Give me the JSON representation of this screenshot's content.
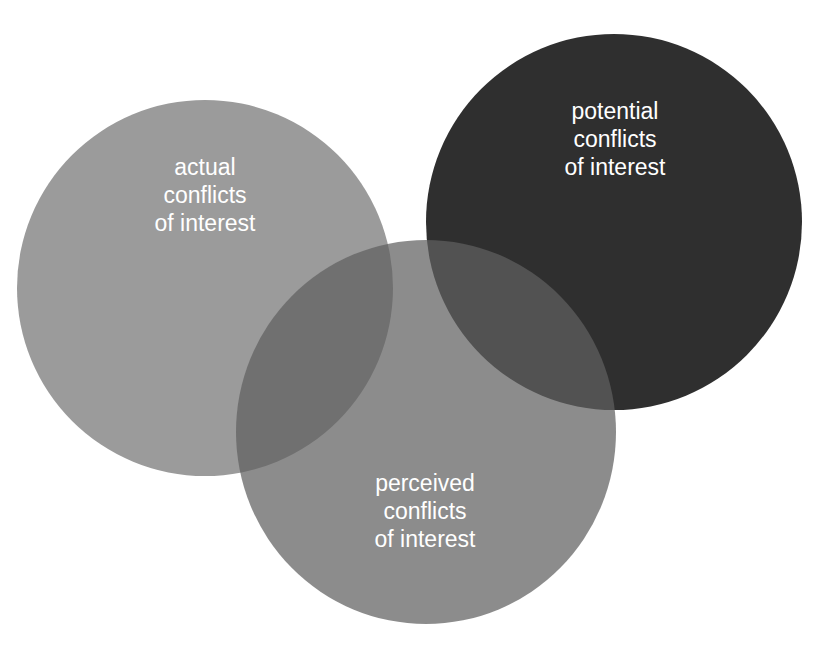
{
  "diagram": {
    "type": "venn",
    "circles": [
      {
        "id": "actual",
        "lines": [
          "actual",
          "conflicts",
          "of interest"
        ],
        "color": "#9b9b9b"
      },
      {
        "id": "potential",
        "lines": [
          "potential",
          "conflicts",
          "of interest"
        ],
        "color": "#2f2f2f"
      },
      {
        "id": "perceived",
        "lines": [
          "perceived",
          "conflicts",
          "of interest"
        ],
        "color": "#5f5f5f"
      }
    ],
    "text_color": "#ffffff",
    "background": "#ffffff"
  }
}
